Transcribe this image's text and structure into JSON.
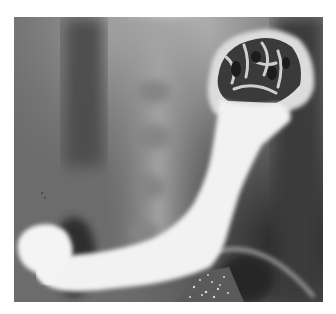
{
  "image": {
    "kind": "radiograph",
    "subject": "barium contrast study of stomach",
    "frame": {
      "left": 14,
      "top": 17,
      "width": 309,
      "height": 285
    },
    "colors": {
      "page_background": "#ffffff",
      "film_gray": "#6e6e6e",
      "film_dark": "#2a2a2a",
      "barium_white": "#f4f4f4",
      "spine_light": "#a0a0a0"
    }
  }
}
